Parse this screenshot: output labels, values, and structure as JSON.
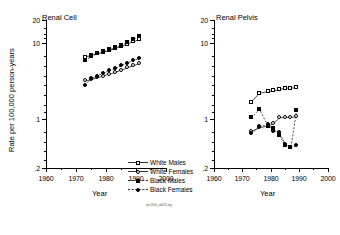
{
  "figure": {
    "microcaption": "rpc1306_ab025.org"
  },
  "legend": {
    "position": "between-panels-below-left",
    "items": [
      {
        "label": "White Males",
        "marker": "open-square",
        "line": "solid"
      },
      {
        "label": "White Females",
        "marker": "open-circle",
        "line": "solid"
      },
      {
        "label": "Black Males",
        "marker": "filled-square",
        "line": "dashed"
      },
      {
        "label": "Black Females",
        "marker": "filled-circle",
        "line": "dashed"
      }
    ]
  },
  "chart_data": [
    {
      "type": "line",
      "title": "Renal Cell",
      "xlabel": "Year",
      "ylabel": "Rate per 100,000 person-years",
      "xlim": [
        1960,
        2000
      ],
      "ylim": [
        0.2,
        20
      ],
      "yscale": "log",
      "xticks": [
        1960,
        1970,
        1980,
        1990,
        2000
      ],
      "xticklabels": [
        "1960",
        "1970",
        "1980",
        "1990",
        "2000"
      ],
      "yticks": [
        0.2,
        1,
        10,
        20
      ],
      "yticklabels": [
        ".2",
        "1",
        "10",
        "20"
      ],
      "grid": false,
      "series": [
        {
          "name": "White Males",
          "marker": "open-square",
          "line": "solid",
          "x": [
            1973,
            1975,
            1977,
            1979,
            1981,
            1983,
            1985,
            1987,
            1989,
            1991
          ],
          "y": [
            6.3,
            6.6,
            7.0,
            7.3,
            7.7,
            8.2,
            8.8,
            9.4,
            10.2,
            10.8
          ]
        },
        {
          "name": "White Females",
          "marker": "open-circle",
          "line": "solid",
          "x": [
            1973,
            1975,
            1977,
            1979,
            1981,
            1983,
            1985,
            1987,
            1989,
            1991
          ],
          "y": [
            3.0,
            3.1,
            3.3,
            3.5,
            3.7,
            3.9,
            4.2,
            4.5,
            4.8,
            5.1
          ]
        },
        {
          "name": "Black Males",
          "marker": "filled-square",
          "line": "dashed",
          "x": [
            1973,
            1975,
            1977,
            1979,
            1981,
            1983,
            1985,
            1987,
            1989,
            1991
          ],
          "y": [
            5.6,
            6.4,
            7.0,
            7.4,
            7.9,
            8.4,
            9.1,
            9.9,
            10.9,
            11.9
          ]
        },
        {
          "name": "Black Females",
          "marker": "filled-circle",
          "line": "dashed",
          "x": [
            1973,
            1975,
            1977,
            1979,
            1981,
            1983,
            1985,
            1987,
            1989,
            1991
          ],
          "y": [
            2.6,
            3.2,
            3.5,
            3.8,
            4.1,
            4.4,
            4.8,
            5.2,
            5.7,
            6.0
          ]
        }
      ]
    },
    {
      "type": "line",
      "title": "Renal Pelvis",
      "xlabel": "Year",
      "ylabel": "",
      "xlim": [
        1960,
        2000
      ],
      "ylim": [
        0.2,
        20
      ],
      "yscale": "log",
      "xticks": [
        1960,
        1970,
        1980,
        1990,
        2000
      ],
      "xticklabels": [
        "1960",
        "1970",
        "1980",
        "1990",
        "2000"
      ],
      "yticks": [
        0.2,
        1,
        10,
        20
      ],
      "yticklabels": [
        ".2",
        "1",
        "10",
        "20"
      ],
      "grid": false,
      "series": [
        {
          "name": "White Males",
          "marker": "open-square",
          "line": "solid",
          "x": [
            1973,
            1976,
            1979,
            1981,
            1983,
            1985,
            1987,
            1989
          ],
          "y": [
            1.55,
            2.05,
            2.15,
            2.2,
            2.3,
            2.4,
            2.4,
            2.45
          ]
        },
        {
          "name": "White Females",
          "marker": "open-circle",
          "line": "solid",
          "x": [
            1973,
            1976,
            1979,
            1981,
            1983,
            1985,
            1987,
            1989
          ],
          "y": [
            0.62,
            0.7,
            0.74,
            0.8,
            0.95,
            0.97,
            0.97,
            0.98
          ]
        },
        {
          "name": "Black Males",
          "marker": "filled-square",
          "line": "dashed",
          "x": [
            1973,
            1976,
            1979,
            1981,
            1983,
            1985,
            1987,
            1989
          ],
          "y": [
            0.95,
            1.25,
            0.72,
            0.68,
            0.55,
            0.4,
            0.38,
            1.2
          ]
        },
        {
          "name": "Black Females",
          "marker": "filled-circle",
          "line": "dashed",
          "x": [
            1973,
            1976,
            1979,
            1981,
            1983,
            1985,
            1987,
            1989
          ],
          "y": [
            0.58,
            0.72,
            0.78,
            0.62,
            0.6,
            0.42,
            0.38,
            0.4
          ]
        }
      ]
    }
  ]
}
